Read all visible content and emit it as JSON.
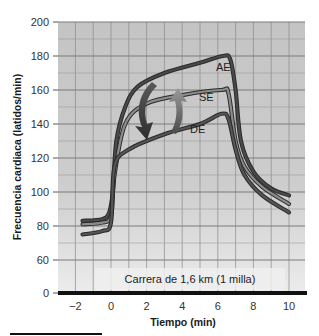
{
  "chart_data": {
    "type": "line",
    "title": "",
    "xlabel": "Tiempo (min)",
    "ylabel": "Frecuencia cardiaca (latidos/min)",
    "xlim": [
      -3,
      11
    ],
    "ylim": [
      0,
      200
    ],
    "y_axis_break": "between 0 and 60",
    "x_ticks": [
      -2,
      0,
      2,
      4,
      6,
      8,
      10
    ],
    "x_tick_labels": [
      "−2",
      "0",
      "2",
      "4",
      "6",
      "8",
      "10"
    ],
    "y_ticks": [
      0,
      60,
      80,
      100,
      120,
      140,
      160,
      180,
      200
    ],
    "y_tick_labels": [
      "0",
      "60",
      "80",
      "100",
      "120",
      "140",
      "160",
      "180",
      "200"
    ],
    "grid": true,
    "annotation": "Carrera de 1,6 km (1 milla)",
    "series": [
      {
        "name": "AE",
        "color": "#4a4a4a",
        "x": [
          -1.6,
          -0.5,
          -0.1,
          0.1,
          0.3,
          0.8,
          1.5,
          3,
          5,
          6.3,
          6.7,
          7.0,
          7.3,
          8,
          9,
          10
        ],
        "values": [
          83,
          84,
          88,
          100,
          130,
          150,
          162,
          170,
          176,
          180,
          178,
          160,
          130,
          112,
          102,
          98
        ]
      },
      {
        "name": "SE",
        "color": "#8c8c8c",
        "x": [
          -1.6,
          -0.5,
          0,
          0.2,
          0.8,
          2,
          4,
          6.2,
          6.6,
          7.0,
          7.5,
          8.5,
          10
        ],
        "values": [
          81,
          82,
          86,
          110,
          140,
          152,
          157,
          160,
          158,
          130,
          115,
          103,
          93
        ]
      },
      {
        "name": "DE",
        "color": "#555555",
        "x": [
          -1.6,
          -0.5,
          0,
          0.2,
          1,
          3,
          5,
          6.2,
          6.6,
          7.0,
          7.5,
          8.5,
          10
        ],
        "values": [
          75,
          77,
          82,
          115,
          125,
          134,
          140,
          146,
          143,
          125,
          110,
          98,
          88
        ]
      }
    ],
    "arrows": [
      {
        "name": "down-arrow",
        "from": "AE",
        "to": "DE",
        "x": 2
      },
      {
        "name": "up-arrow",
        "from": "DE",
        "to": "SE",
        "x": 3.8
      }
    ]
  }
}
